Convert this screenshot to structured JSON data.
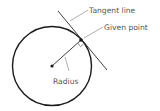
{
  "diagram": {
    "labels": {
      "tangent_line": "Tangent line",
      "given_point": "Given point",
      "radius": "Radius"
    },
    "colors": {
      "stroke": "#1a1a1a",
      "text": "#555555",
      "leader": "#777777"
    }
  }
}
